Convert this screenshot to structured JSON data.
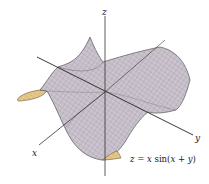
{
  "figure": {
    "type": "3d-surface-plot",
    "equation": {
      "lhs": "z",
      "eq": " = ",
      "x": "x",
      "sin": " sin(",
      "x2": "x",
      "plus": " + ",
      "y": "y",
      "close": ")"
    },
    "equation_text": "z = x sin(x + y)",
    "axes": {
      "x_label": "x",
      "y_label": "y",
      "z_label": "z"
    },
    "colors": {
      "surface_top": "#c9c2cc",
      "surface_mesh": "#8e8794",
      "surface_underside": "#e8c98a",
      "underside_mesh": "#b79a5c",
      "axis": "#333333",
      "outline": "#555555"
    }
  }
}
